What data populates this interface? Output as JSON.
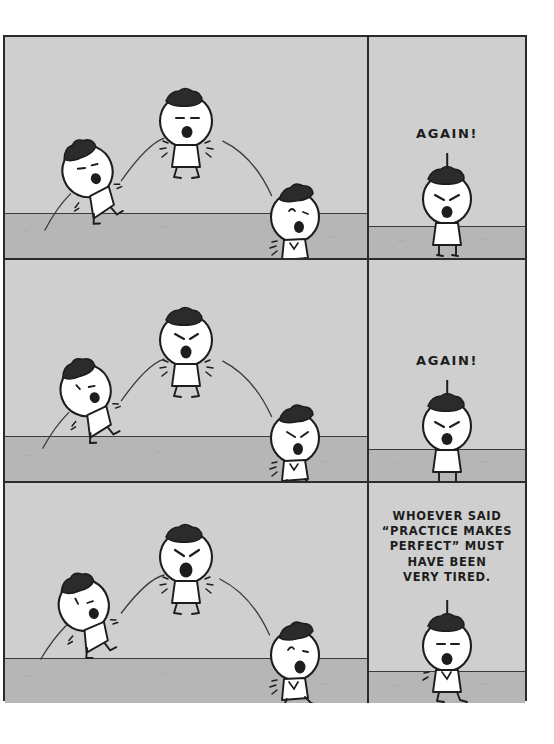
{
  "comic": {
    "title": "Whoever said practice makes perfect",
    "background_color": "#ffffff",
    "page_border_color": "#2b2b2b",
    "sky_color": "#cfcfcf",
    "ground_color": "#b6b6b6",
    "ink_color": "#1d1d1d",
    "character_fill": "#ffffff",
    "hair_color": "#2b2b2b"
  },
  "rows": [
    {
      "id": "row-1",
      "left_panel": {
        "name": "jump-sequence-panel",
        "characters": [
          {
            "pose": "takeoff-leaning",
            "expression": "determined-eyes-open-mouth"
          },
          {
            "pose": "apex-airborne",
            "expression": "straining-open-mouth"
          },
          {
            "pose": "landing-crouch",
            "expression": "surprised-open-mouth"
          }
        ],
        "motion_arcs": 2
      },
      "right_panel": {
        "name": "shout-panel",
        "caption": "AGAIN!",
        "character": {
          "pose": "standing",
          "expression": "angry-brows-open-mouth"
        }
      }
    },
    {
      "id": "row-2",
      "left_panel": {
        "name": "jump-sequence-panel",
        "characters": [
          {
            "pose": "takeoff-leaning",
            "expression": "tired-eyes-open-mouth"
          },
          {
            "pose": "apex-airborne",
            "expression": "angry-brows-open-mouth"
          },
          {
            "pose": "landing-crouch",
            "expression": "angry-brows-open-mouth"
          }
        ],
        "motion_arcs": 2
      },
      "right_panel": {
        "name": "shout-panel",
        "caption": "AGAIN!",
        "character": {
          "pose": "standing",
          "expression": "angry-brows-open-mouth"
        }
      }
    },
    {
      "id": "row-3",
      "left_panel": {
        "name": "jump-sequence-panel",
        "characters": [
          {
            "pose": "takeoff-leaning",
            "expression": "weary-eyes-open-mouth"
          },
          {
            "pose": "apex-airborne",
            "expression": "angry-brows-wide-mouth"
          },
          {
            "pose": "landing-crouch",
            "expression": "exhausted-open-mouth"
          }
        ],
        "motion_arcs": 2
      },
      "right_panel": {
        "name": "punchline-panel",
        "caption": "WHOEVER SAID\n“PRACTICE MAKES\nPERFECT” MUST\nHAVE BEEN\nVERY TIRED.",
        "character": {
          "pose": "standing-slumped",
          "expression": "exhausted-flat-eyes"
        }
      }
    }
  ],
  "ground_specks": [
    "ˋ′ˋ",
    "ˋ′ˋ",
    "ˋ′ˋ",
    "ˋ′ˋ",
    "ˋ′ˋ",
    "ˋ′ˋ"
  ]
}
